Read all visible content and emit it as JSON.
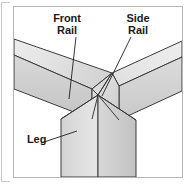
{
  "figure": {
    "frame_color": "#b5b5b5",
    "background_color": "#ffffff",
    "line_color": "#3a3a3a",
    "labels": {
      "front_rail": "Front\nRail",
      "side_rail": "Side\nRail",
      "leg": "Leg"
    },
    "parts": [
      {
        "name": "front-rail",
        "description": "Horizontal rail running from lower-left to the joint",
        "top_face_color": "#e3e3e3",
        "front_face_color": "#cfcfcf"
      },
      {
        "name": "side-rail",
        "description": "Horizontal rail running from the joint to the upper-right",
        "top_face_color": "#e6e6e6",
        "front_face_color": "#d2d2d2"
      },
      {
        "name": "leg",
        "description": "Vertical post descending from the joint",
        "left_face_color": "#dedede",
        "right_face_color": "#cacaca"
      }
    ],
    "leader_lines": [
      {
        "name": "front-rail-leader",
        "from": "Front Rail label",
        "to": "front rail body"
      },
      {
        "name": "side-rail-leader",
        "from": "Side Rail label",
        "to": "joint corner"
      },
      {
        "name": "leg-leader",
        "from": "Leg label",
        "to": "leg left face"
      }
    ]
  }
}
